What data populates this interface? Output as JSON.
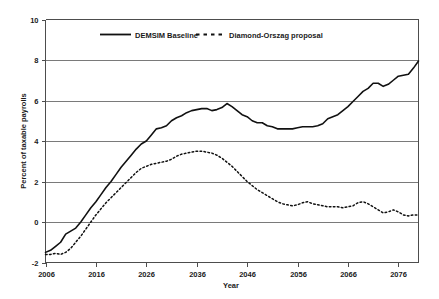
{
  "chart_data": {
    "type": "line",
    "title": "",
    "xlabel": "Year",
    "ylabel": "Percent of taxable payrolls",
    "xlim": [
      2006,
      2080
    ],
    "ylim": [
      -2,
      10
    ],
    "xticks": [
      2006,
      2016,
      2026,
      2036,
      2046,
      2056,
      2066,
      2076
    ],
    "yticks": [
      -2,
      0,
      2,
      4,
      6,
      8,
      10
    ],
    "xtick_labels": [
      "2006",
      "2016",
      "2026",
      "2036",
      "2046",
      "2056",
      "2066",
      "2076"
    ],
    "ytick_labels": [
      "-2",
      "0",
      "2",
      "4",
      "6",
      "8",
      "10"
    ],
    "grid": true,
    "legend_position": "top-center",
    "series": [
      {
        "name": "DEMSIM Baseline",
        "style": "solid",
        "color": "#111111",
        "x": [
          2006,
          2007,
          2008,
          2009,
          2010,
          2011,
          2012,
          2013,
          2014,
          2015,
          2016,
          2017,
          2018,
          2019,
          2020,
          2021,
          2022,
          2023,
          2024,
          2025,
          2026,
          2027,
          2028,
          2029,
          2030,
          2031,
          2032,
          2033,
          2034,
          2035,
          2036,
          2037,
          2038,
          2039,
          2040,
          2041,
          2042,
          2043,
          2044,
          2045,
          2046,
          2047,
          2048,
          2049,
          2050,
          2051,
          2052,
          2053,
          2054,
          2055,
          2056,
          2057,
          2058,
          2059,
          2060,
          2061,
          2062,
          2063,
          2064,
          2065,
          2066,
          2067,
          2068,
          2069,
          2070,
          2071,
          2072,
          2073,
          2074,
          2075,
          2076,
          2077,
          2078,
          2079,
          2080
        ],
        "values": [
          -1.5,
          -1.4,
          -1.2,
          -1.0,
          -0.6,
          -0.45,
          -0.3,
          0.0,
          0.35,
          0.7,
          1.0,
          1.35,
          1.7,
          2.0,
          2.35,
          2.7,
          3.0,
          3.3,
          3.6,
          3.85,
          4.0,
          4.3,
          4.6,
          4.65,
          4.75,
          5.0,
          5.15,
          5.25,
          5.4,
          5.5,
          5.55,
          5.6,
          5.6,
          5.5,
          5.55,
          5.65,
          5.85,
          5.7,
          5.5,
          5.3,
          5.2,
          5.0,
          4.9,
          4.9,
          4.75,
          4.7,
          4.6,
          4.6,
          4.6,
          4.6,
          4.65,
          4.7,
          4.7,
          4.7,
          4.75,
          4.85,
          5.1,
          5.2,
          5.3,
          5.5,
          5.7,
          5.95,
          6.2,
          6.45,
          6.6,
          6.85,
          6.85,
          6.7,
          6.8,
          7.0,
          7.2,
          7.25,
          7.3,
          7.6,
          7.95
        ]
      },
      {
        "name": "Diamond-Orszag proposal",
        "style": "dashed",
        "color": "#111111",
        "x": [
          2006,
          2007,
          2008,
          2009,
          2010,
          2011,
          2012,
          2013,
          2014,
          2015,
          2016,
          2017,
          2018,
          2019,
          2020,
          2021,
          2022,
          2023,
          2024,
          2025,
          2026,
          2027,
          2028,
          2029,
          2030,
          2031,
          2032,
          2033,
          2034,
          2035,
          2036,
          2037,
          2038,
          2039,
          2040,
          2041,
          2042,
          2043,
          2044,
          2045,
          2046,
          2047,
          2048,
          2049,
          2050,
          2051,
          2052,
          2053,
          2054,
          2055,
          2056,
          2057,
          2058,
          2059,
          2060,
          2061,
          2062,
          2063,
          2064,
          2065,
          2066,
          2067,
          2068,
          2069,
          2070,
          2071,
          2072,
          2073,
          2074,
          2075,
          2076,
          2077,
          2078,
          2079,
          2080
        ],
        "values": [
          -1.6,
          -1.6,
          -1.55,
          -1.6,
          -1.5,
          -1.3,
          -1.0,
          -0.7,
          -0.35,
          0.0,
          0.35,
          0.65,
          0.95,
          1.2,
          1.45,
          1.7,
          1.95,
          2.2,
          2.45,
          2.65,
          2.75,
          2.85,
          2.9,
          2.95,
          3.0,
          3.1,
          3.25,
          3.35,
          3.4,
          3.45,
          3.5,
          3.5,
          3.45,
          3.4,
          3.3,
          3.15,
          2.95,
          2.75,
          2.5,
          2.25,
          2.0,
          1.8,
          1.6,
          1.45,
          1.3,
          1.15,
          1.0,
          0.9,
          0.85,
          0.8,
          0.85,
          0.95,
          1.0,
          0.9,
          0.85,
          0.8,
          0.75,
          0.75,
          0.75,
          0.7,
          0.75,
          0.8,
          0.95,
          1.0,
          0.9,
          0.75,
          0.6,
          0.45,
          0.5,
          0.6,
          0.5,
          0.35,
          0.3,
          0.35,
          0.35
        ]
      }
    ]
  },
  "axes": {
    "y_title": "Percent of taxable payrolls",
    "x_title": "Year"
  },
  "legend": {
    "items": [
      {
        "label": "DEMSIM Baseline",
        "style": "solid"
      },
      {
        "label": "Diamond-Orszag proposal",
        "style": "dashed"
      }
    ]
  }
}
